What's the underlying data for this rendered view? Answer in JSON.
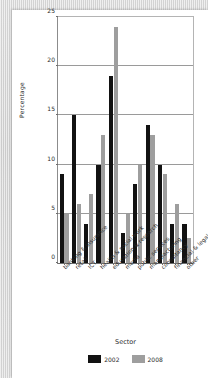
{
  "chart_data": {
    "type": "bar",
    "title": "",
    "xlabel": "Sector",
    "ylabel": "Percentage",
    "ylim": [
      0,
      25
    ],
    "yticks": [
      0,
      5,
      10,
      15,
      20,
      25
    ],
    "grid": true,
    "legend_position": "bottom",
    "categories": [
      "banking & insurance",
      "retail",
      "ICT",
      "health & social work",
      "education & research",
      "media",
      "public services",
      "manufacturing",
      "consultancy",
      "financial & legal",
      "other"
    ],
    "series": [
      {
        "name": "2002",
        "color": "#121212",
        "values": [
          9,
          15,
          4,
          10,
          19,
          3,
          8,
          14,
          10,
          4,
          4
        ]
      },
      {
        "name": "2008",
        "color": "#9e9e9e",
        "values": [
          5,
          6,
          7,
          13,
          24,
          5,
          10,
          13,
          9,
          6,
          2.5
        ]
      }
    ]
  }
}
